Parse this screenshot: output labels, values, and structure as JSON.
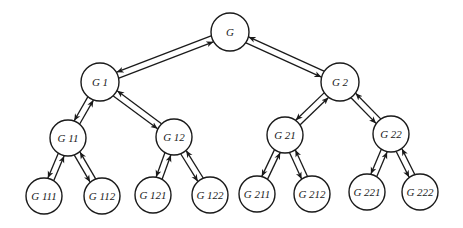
{
  "diagram": {
    "type": "binary-tree",
    "colors": {
      "stroke": "#1a1a1a",
      "fill": "#ffffff"
    },
    "nodes": [
      {
        "id": "G",
        "label": "G",
        "x": 230,
        "y": 32,
        "r": 19
      },
      {
        "id": "G1",
        "label": "G 1",
        "x": 100,
        "y": 82,
        "r": 19
      },
      {
        "id": "G2",
        "label": "G 2",
        "x": 340,
        "y": 82,
        "r": 19
      },
      {
        "id": "G11",
        "label": "G 11",
        "x": 68,
        "y": 138,
        "r": 18
      },
      {
        "id": "G12",
        "label": "G 12",
        "x": 174,
        "y": 137,
        "r": 18
      },
      {
        "id": "G21",
        "label": "G 21",
        "x": 285,
        "y": 135,
        "r": 18
      },
      {
        "id": "G22",
        "label": "G 22",
        "x": 391,
        "y": 134,
        "r": 18
      },
      {
        "id": "G111",
        "label": "G 111",
        "x": 44,
        "y": 196,
        "r": 18
      },
      {
        "id": "G112",
        "label": "G 112",
        "x": 102,
        "y": 196,
        "r": 18
      },
      {
        "id": "G121",
        "label": "G 121",
        "x": 153,
        "y": 195,
        "r": 18
      },
      {
        "id": "G122",
        "label": "G 122",
        "x": 210,
        "y": 195,
        "r": 18
      },
      {
        "id": "G211",
        "label": "G 211",
        "x": 257,
        "y": 194,
        "r": 18
      },
      {
        "id": "G212",
        "label": "G 212",
        "x": 312,
        "y": 194,
        "r": 18
      },
      {
        "id": "G221",
        "label": "G 221",
        "x": 367,
        "y": 192,
        "r": 18
      },
      {
        "id": "G222",
        "label": "G 222",
        "x": 420,
        "y": 192,
        "r": 18
      }
    ],
    "edges": [
      {
        "parent": "G",
        "child": "G1"
      },
      {
        "parent": "G",
        "child": "G2"
      },
      {
        "parent": "G1",
        "child": "G11"
      },
      {
        "parent": "G1",
        "child": "G12"
      },
      {
        "parent": "G2",
        "child": "G21"
      },
      {
        "parent": "G2",
        "child": "G22"
      },
      {
        "parent": "G11",
        "child": "G111"
      },
      {
        "parent": "G11",
        "child": "G112"
      },
      {
        "parent": "G12",
        "child": "G121"
      },
      {
        "parent": "G12",
        "child": "G122"
      },
      {
        "parent": "G21",
        "child": "G211"
      },
      {
        "parent": "G21",
        "child": "G212"
      },
      {
        "parent": "G22",
        "child": "G221"
      },
      {
        "parent": "G22",
        "child": "G222"
      }
    ]
  }
}
